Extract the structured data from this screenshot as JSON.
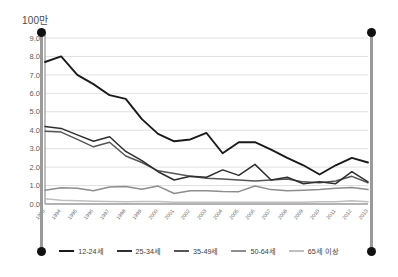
{
  "chart_data": {
    "type": "line",
    "title": "",
    "subtitle": "",
    "unit_label": "100만",
    "xlabel": "",
    "ylabel": "",
    "ylim": [
      0.0,
      9.0
    ],
    "ytick_labels": [
      "0.0",
      "1.0",
      "2.0",
      "3.0",
      "4.0",
      "5.0",
      "6.0",
      "7.0",
      "8.0",
      "9.0"
    ],
    "ytick_values": [
      0.0,
      1.0,
      2.0,
      3.0,
      4.0,
      5.0,
      6.0,
      7.0,
      8.0,
      9.0
    ],
    "grid": true,
    "legend_position": "bottom",
    "categories": [
      "1993",
      "1994",
      "1995",
      "1996",
      "1997",
      "1998",
      "1999",
      "2000",
      "2001",
      "2002",
      "2003",
      "2004",
      "2005",
      "2006",
      "2007",
      "2008",
      "2009",
      "2010",
      "2011",
      "2012",
      "2013"
    ],
    "series": [
      {
        "name": "12-24세",
        "color": "#1a1a1a",
        "values": [
          7.7,
          8.0,
          7.0,
          6.5,
          5.9,
          5.7,
          4.6,
          3.8,
          3.4,
          3.5,
          3.85,
          2.75,
          3.35,
          3.35,
          2.95,
          2.5,
          2.1,
          1.6,
          2.1,
          2.5,
          2.25
        ]
      },
      {
        "name": "25-34세",
        "color": "#2e2e2e",
        "values": [
          4.2,
          4.1,
          3.75,
          3.4,
          3.65,
          2.85,
          2.35,
          1.75,
          1.3,
          1.5,
          1.45,
          1.85,
          1.55,
          2.15,
          1.3,
          1.45,
          1.1,
          1.2,
          1.1,
          1.75,
          1.2
        ]
      },
      {
        "name": "35-49세",
        "color": "#565656",
        "values": [
          3.95,
          3.9,
          3.5,
          3.1,
          3.35,
          2.6,
          2.25,
          1.8,
          1.65,
          1.5,
          1.4,
          1.35,
          1.3,
          1.25,
          1.3,
          1.35,
          1.2,
          1.15,
          1.25,
          1.5,
          1.15
        ]
      },
      {
        "name": "50-64세",
        "color": "#8d8d8d",
        "values": [
          0.75,
          0.88,
          0.85,
          0.72,
          0.92,
          0.95,
          0.8,
          0.97,
          0.57,
          0.72,
          0.72,
          0.68,
          0.67,
          0.98,
          0.78,
          0.72,
          0.75,
          0.78,
          0.85,
          0.9,
          0.78
        ]
      },
      {
        "name": "65세 이상",
        "color": "#bfbfbf",
        "values": [
          0.28,
          0.2,
          0.17,
          0.15,
          0.14,
          0.12,
          0.13,
          0.13,
          0.1,
          0.1,
          0.1,
          0.1,
          0.1,
          0.1,
          0.1,
          0.1,
          0.1,
          0.12,
          0.12,
          0.18,
          0.12
        ]
      }
    ]
  },
  "legend": {
    "items": [
      {
        "label": "12-24세",
        "color": "#1a1a1a"
      },
      {
        "label": "25-34세",
        "color": "#2e2e2e"
      },
      {
        "label": "35-49세",
        "color": "#565656"
      },
      {
        "label": "50-64세",
        "color": "#8d8d8d"
      },
      {
        "label": "65세 이상",
        "color": "#bfbfbf"
      }
    ]
  },
  "selection": {
    "handle_color": "#111111",
    "bar_color": "#9a9a9a"
  }
}
